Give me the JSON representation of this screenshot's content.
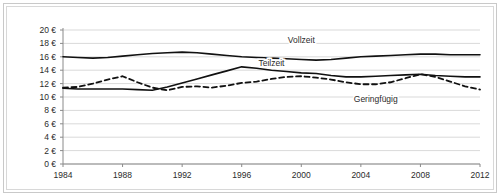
{
  "chart_data": {
    "type": "line",
    "title": "",
    "xlabel": "",
    "ylabel": "",
    "xlim": [
      1984,
      2012
    ],
    "ylim": [
      0,
      20
    ],
    "grid": true,
    "legend_position": "inline-labels",
    "currency_symbol": "€",
    "x_ticks": [
      "1984",
      "1988",
      "1992",
      "1996",
      "2000",
      "2004",
      "2008",
      "2012"
    ],
    "x_tick_values": [
      1984,
      1988,
      1992,
      1996,
      2000,
      2004,
      2008,
      2012
    ],
    "y_ticks": [
      "0 €",
      "2 €",
      "4 €",
      "6 €",
      "8 €",
      "10 €",
      "12 €",
      "14 €",
      "16 €",
      "18 €",
      "20 €"
    ],
    "y_tick_values": [
      0,
      2,
      4,
      6,
      8,
      10,
      12,
      14,
      16,
      18,
      20
    ],
    "x": [
      1984,
      1985,
      1986,
      1987,
      1988,
      1989,
      1990,
      1991,
      1992,
      1993,
      1994,
      1995,
      1996,
      1997,
      1998,
      1999,
      2000,
      2001,
      2002,
      2003,
      2004,
      2005,
      2006,
      2007,
      2008,
      2009,
      2010,
      2011,
      2012
    ],
    "series": [
      {
        "name": "Vollzeit",
        "style": "solid",
        "color": "#111111",
        "label_x": 2000,
        "label_y": 18.0,
        "values": [
          16.0,
          15.9,
          15.8,
          15.9,
          16.1,
          16.3,
          16.5,
          16.6,
          16.7,
          16.6,
          16.4,
          16.2,
          16.0,
          15.9,
          15.8,
          15.7,
          15.6,
          15.5,
          15.6,
          15.8,
          16.0,
          16.1,
          16.2,
          16.3,
          16.4,
          16.4,
          16.3,
          16.3,
          16.3
        ]
      },
      {
        "name": "Teilzeit",
        "style": "solid",
        "color": "#111111",
        "label_x": 1998,
        "label_y": 14.6,
        "values": [
          11.3,
          11.2,
          11.2,
          11.2,
          11.2,
          11.1,
          11.0,
          11.5,
          12.1,
          12.7,
          13.3,
          13.9,
          14.5,
          14.3,
          14.0,
          13.8,
          13.6,
          13.5,
          13.2,
          13.0,
          13.0,
          13.1,
          13.2,
          13.3,
          13.4,
          13.2,
          13.1,
          13.0,
          13.0
        ]
      },
      {
        "name": "Geringfügig",
        "style": "dashed",
        "color": "#111111",
        "label_x": 2005,
        "label_y": 9.3,
        "values": [
          11.4,
          11.5,
          12.0,
          12.6,
          13.1,
          12.2,
          11.4,
          11.0,
          11.5,
          11.6,
          11.4,
          11.7,
          12.1,
          12.3,
          12.7,
          13.0,
          13.1,
          12.9,
          12.6,
          12.2,
          11.9,
          11.9,
          12.2,
          12.8,
          13.4,
          13.0,
          12.3,
          11.6,
          11.1
        ]
      }
    ]
  }
}
